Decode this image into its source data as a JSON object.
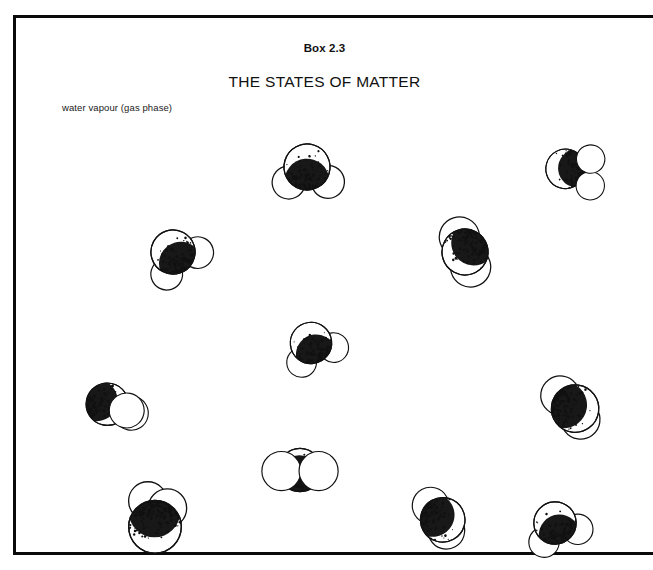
{
  "box": {
    "number_label": "Box 2.3",
    "title": "THE STATES OF MATTER",
    "phase_label": "water vapour (gas phase)",
    "frame_color": "#0a0a0a",
    "background_color": "#ffffff",
    "text_color": "#111111"
  },
  "diagram": {
    "atom_colors": {
      "oxygen_stipple": "#111111",
      "hydrogen_fill": "#ffffff",
      "outline": "#111111"
    },
    "molecule_count": 11,
    "molecules": [
      {
        "id": "molecule-1",
        "x": 252,
        "y": 112,
        "rotation": -28,
        "style": "front-oxygen-upper",
        "scale": 1.0
      },
      {
        "id": "molecule-2",
        "x": 519,
        "y": 117,
        "rotation": 152,
        "style": "front-oxygen-lower",
        "scale": 0.86
      },
      {
        "id": "molecule-3",
        "x": 118,
        "y": 197,
        "rotation": -62,
        "style": "front-oxygen-upper",
        "scale": 0.96
      },
      {
        "id": "molecule-4",
        "x": 410,
        "y": 197,
        "rotation": 118,
        "style": "edge-on",
        "scale": 1.0
      },
      {
        "id": "molecule-5",
        "x": 256,
        "y": 288,
        "rotation": -52,
        "style": "front-oxygen-upper",
        "scale": 0.9
      },
      {
        "id": "molecule-6",
        "x": 56,
        "y": 350,
        "rotation": 12,
        "style": "behind-oxygen-left",
        "scale": 0.92
      },
      {
        "id": "molecule-7",
        "x": 518,
        "y": 352,
        "rotation": 8,
        "style": "oxygen-dominant",
        "scale": 1.0
      },
      {
        "id": "molecule-8",
        "x": 245,
        "y": 415,
        "rotation": 0,
        "style": "oxygen-behind-center",
        "scale": 0.94
      },
      {
        "id": "molecule-9",
        "x": 100,
        "y": 468,
        "rotation": 0,
        "style": "oxygen-front-large",
        "scale": 1.04
      },
      {
        "id": "molecule-10",
        "x": 386,
        "y": 463,
        "rotation": 16,
        "style": "oxygen-dominant",
        "scale": 0.94
      },
      {
        "id": "molecule-11",
        "x": 500,
        "y": 468,
        "rotation": -48,
        "style": "front-oxygen-upper",
        "scale": 0.92
      }
    ]
  }
}
